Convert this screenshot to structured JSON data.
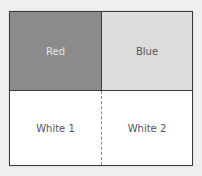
{
  "diagram": {
    "cells": [
      {
        "label": "Red",
        "fill": "#8b8b8b"
      },
      {
        "label": "Blue",
        "fill": "#dcdcdc"
      },
      {
        "label": "White 1",
        "fill": "#ffffff"
      },
      {
        "label": "White 2",
        "fill": "#ffffff"
      }
    ],
    "divider_bottom_style": "dashed"
  }
}
